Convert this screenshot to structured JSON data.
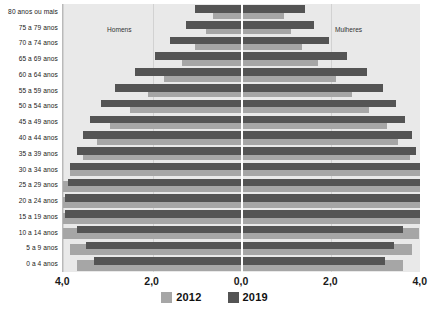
{
  "chart_data": {
    "type": "bar",
    "subtype": "population-pyramid",
    "title": "",
    "xlabel": "",
    "ylabel": "",
    "xlim": [
      -4.6,
      4.6
    ],
    "xtick_labels": [
      "4,0",
      "2,0",
      "0,0",
      "2,0",
      "4,0"
    ],
    "xtick_values": [
      -4.0,
      -2.0,
      0.0,
      2.0,
      4.0
    ],
    "grid": true,
    "legend_position": "bottom",
    "side_labels": {
      "left": "Homens",
      "right": "Mulheres"
    },
    "colors": {
      "series_2012": "#a6a6a6",
      "series_2019": "#545454",
      "plot_background": "#e9e9e9",
      "gridline": "#d2d2d2",
      "centerline": "#ffffff",
      "text": "#1a1a1a"
    },
    "categories": [
      "80 anos ou mais",
      "75 a 79 anos",
      "70 a 74 anos",
      "65 a 69 anos",
      "60 a 64 anos",
      "55 a 59 anos",
      "50 a 54 anos",
      "45 a 49 anos",
      "40 a 44 anos",
      "35 a 39 anos",
      "30 a 34 anos",
      "25 a 29 anos",
      "20 a 24 anos",
      "15 a 19 anos",
      "10 a 14 anos",
      "5 a 9 anos",
      "0 a 4 anos"
    ],
    "series": [
      {
        "name": "2012",
        "men": [
          0.65,
          0.8,
          1.05,
          1.35,
          1.75,
          2.1,
          2.5,
          2.95,
          3.25,
          3.55,
          3.85,
          4.1,
          4.15,
          4.05,
          4.0,
          3.85,
          3.7
        ],
        "women": [
          0.95,
          1.1,
          1.35,
          1.7,
          2.1,
          2.45,
          2.85,
          3.25,
          3.5,
          3.75,
          4.0,
          4.2,
          4.2,
          4.05,
          3.95,
          3.8,
          3.6
        ]
      },
      {
        "name": "2019",
        "men": [
          1.05,
          1.25,
          1.6,
          1.95,
          2.4,
          2.85,
          3.15,
          3.4,
          3.55,
          3.7,
          3.85,
          3.9,
          3.95,
          3.95,
          3.7,
          3.5,
          3.3
        ],
        "women": [
          1.4,
          1.6,
          1.95,
          2.35,
          2.8,
          3.15,
          3.45,
          3.65,
          3.8,
          3.9,
          4.0,
          4.05,
          4.05,
          4.0,
          3.6,
          3.4,
          3.2
        ]
      }
    ]
  },
  "legend": {
    "items": [
      {
        "label": "2012",
        "color": "#a6a6a6"
      },
      {
        "label": "2019",
        "color": "#545454"
      }
    ]
  }
}
